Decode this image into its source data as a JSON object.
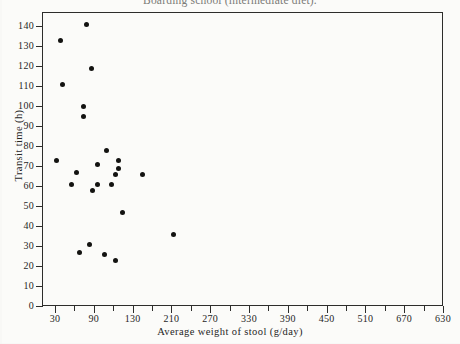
{
  "chart_data": {
    "type": "scatter",
    "title": "Boarding school (intermediate diet).",
    "xlabel": "Average weight of stool (g/day)",
    "ylabel": "Transit time (h)",
    "xlim": [
      0,
      630
    ],
    "ylim": [
      0,
      145
    ],
    "grid": false,
    "legend": null,
    "x_ticks": [
      30,
      90,
      130,
      210,
      270,
      330,
      390,
      450,
      510,
      670,
      630
    ],
    "x_tick_labels": [
      "30",
      "90",
      "130",
      "210",
      "270",
      "330",
      "390",
      "450",
      "510",
      "670",
      "630"
    ],
    "x_tick_positions": [
      30,
      90,
      150,
      210,
      270,
      330,
      390,
      450,
      510,
      570,
      630
    ],
    "x_minor_tick_positions": [
      60,
      120,
      180,
      240,
      300,
      360,
      420,
      480,
      540,
      600
    ],
    "y_ticks": [
      0,
      10,
      20,
      30,
      40,
      50,
      60,
      70,
      80,
      90,
      100,
      110,
      120,
      130,
      140
    ],
    "y_tick_labels": [
      "0",
      "10",
      "20",
      "30",
      "40",
      "50",
      "60",
      "70",
      "80",
      "90",
      "100",
      "110",
      "120",
      "130",
      "140"
    ],
    "marker": "filled-circle",
    "marker_color": "#131311",
    "marker_size_px": 5,
    "points": [
      {
        "x": 78,
        "y": 141
      },
      {
        "x": 38,
        "y": 133
      },
      {
        "x": 86,
        "y": 119
      },
      {
        "x": 42,
        "y": 111
      },
      {
        "x": 74,
        "y": 100
      },
      {
        "x": 74,
        "y": 95
      },
      {
        "x": 110,
        "y": 78
      },
      {
        "x": 32,
        "y": 73
      },
      {
        "x": 128,
        "y": 73
      },
      {
        "x": 96,
        "y": 71
      },
      {
        "x": 128,
        "y": 69
      },
      {
        "x": 63,
        "y": 67
      },
      {
        "x": 124,
        "y": 66
      },
      {
        "x": 166,
        "y": 66
      },
      {
        "x": 56,
        "y": 61
      },
      {
        "x": 96,
        "y": 61
      },
      {
        "x": 118,
        "y": 61
      },
      {
        "x": 88,
        "y": 58
      },
      {
        "x": 134,
        "y": 47
      },
      {
        "x": 213,
        "y": 36
      },
      {
        "x": 83,
        "y": 31
      },
      {
        "x": 68,
        "y": 27
      },
      {
        "x": 107,
        "y": 26
      },
      {
        "x": 124,
        "y": 23
      }
    ]
  }
}
